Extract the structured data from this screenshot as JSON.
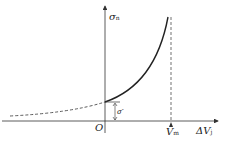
{
  "diagram": {
    "y_axis_label": "σ",
    "y_axis_sub": "n",
    "x_axis_label": "ΔV",
    "x_axis_sub": "j",
    "origin_label": "O",
    "asymptote_label": "V",
    "asymptote_sub": "m",
    "offset_label": "σ",
    "offset_sup": "-",
    "line_color": "#222222"
  }
}
